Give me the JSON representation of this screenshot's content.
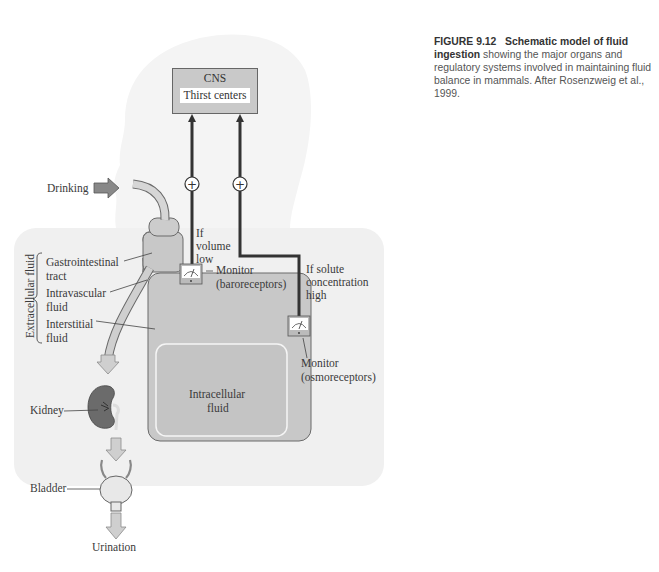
{
  "caption": {
    "figure_number": "FIGURE 9.12",
    "title": "Schematic model of fluid ingestion",
    "text": "showing the major organs and regulatory systems involved in maintaining fluid balance in mammals. After Rosenzweig et al., 1999."
  },
  "cns": {
    "title": "CNS",
    "subtitle": "Thirst centers"
  },
  "labels": {
    "drinking": "Drinking",
    "extracellular_fluid": "Extracellular fluid",
    "gi_tract_1": "Gastrointestinal",
    "gi_tract_2": "tract",
    "intravascular_1": "Intravascular",
    "intravascular_2": "fluid",
    "interstitial_1": "Interstitial",
    "interstitial_2": "fluid",
    "intracellular_1": "Intracellular",
    "intracellular_2": "fluid",
    "kidney": "Kidney",
    "bladder": "Bladder",
    "urination": "Urination",
    "if_volume_1": "If",
    "if_volume_2": "volume",
    "if_volume_3": "low",
    "baro_1": "Monitor",
    "baro_2": "(baroreceptors)",
    "if_solute_1": "If solute",
    "if_solute_2": "concentration",
    "if_solute_3": "high",
    "osmo_1": "Monitor",
    "osmo_2": "(osmoreceptors)",
    "plus_symbol": "+"
  },
  "colors": {
    "head_silhouette": "#f3f3f3",
    "body_region": "#efefef",
    "compartment_fill": "#c8c8c8",
    "compartment_stroke": "#6a6a6a",
    "kidney_fill": "#6b6b6b",
    "arrow_fill": "#cfcfcf",
    "drinking_arrow": "#888888",
    "signal_line": "#333333"
  }
}
